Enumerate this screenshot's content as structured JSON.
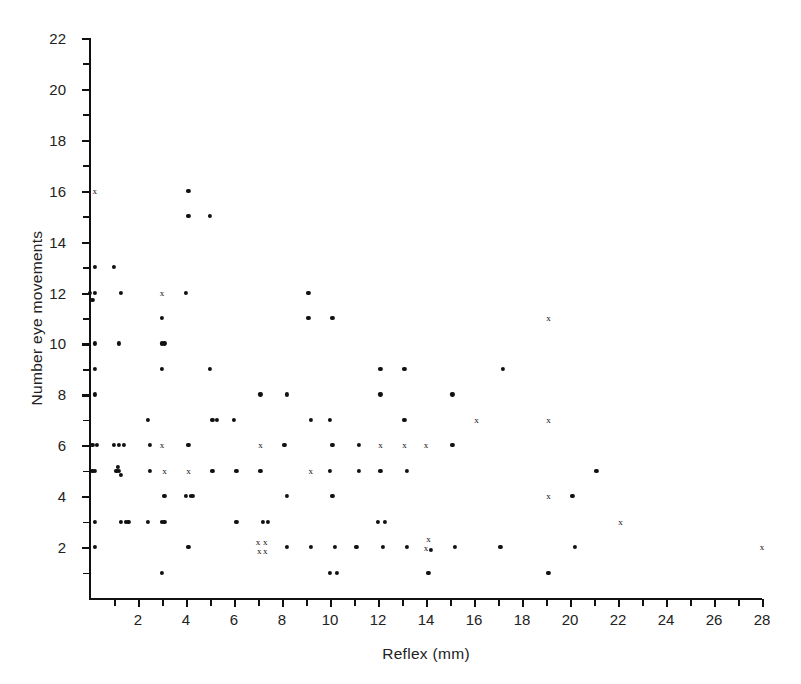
{
  "chart_data": {
    "type": "scatter",
    "title": "",
    "xlabel": "Reflex (mm)",
    "ylabel": "Number eye movements",
    "xlim": [
      0,
      28
    ],
    "ylim": [
      0,
      22
    ],
    "xticks_major": [
      2,
      4,
      6,
      8,
      10,
      12,
      14,
      16,
      18,
      20,
      22,
      24,
      26,
      28
    ],
    "xticks_minor_step": 1,
    "yticks_major": [
      2,
      4,
      6,
      8,
      10,
      12,
      14,
      16,
      18,
      20,
      22
    ],
    "yticks_minor_step": 1,
    "xticklabels": [
      "2",
      "4",
      "6",
      "8",
      "10",
      "12",
      "14",
      "16",
      "18",
      "20",
      "22",
      "24",
      "26",
      "28"
    ],
    "yticklabels": [
      "2",
      "4",
      "6",
      "8",
      "10",
      "12",
      "14",
      "16",
      "18",
      "20",
      "22"
    ],
    "grid": false,
    "legend": false,
    "marker_styles": {
      "dot": "filled round dot",
      "cross": "small x glyph"
    },
    "points": [
      {
        "x": 0.2,
        "y": 16,
        "m": "cross"
      },
      {
        "x": 0.2,
        "y": 13,
        "m": "dot"
      },
      {
        "x": 0.0,
        "y": 12,
        "m": "dot"
      },
      {
        "x": 0.2,
        "y": 12,
        "m": "dot"
      },
      {
        "x": 0.1,
        "y": 11.7,
        "m": "dot"
      },
      {
        "x": 0.2,
        "y": 10,
        "m": "dot"
      },
      {
        "x": 0.2,
        "y": 9,
        "m": "dot"
      },
      {
        "x": 0.2,
        "y": 8,
        "m": "dot"
      },
      {
        "x": 0.1,
        "y": 6,
        "m": "dot"
      },
      {
        "x": 0.3,
        "y": 6,
        "m": "dot"
      },
      {
        "x": 0.2,
        "y": 5,
        "m": "dot"
      },
      {
        "x": 0.1,
        "y": 5,
        "m": "dot"
      },
      {
        "x": 0.2,
        "y": 3,
        "m": "dot"
      },
      {
        "x": 0.2,
        "y": 2,
        "m": "dot"
      },
      {
        "x": 1.0,
        "y": 13,
        "m": "dot"
      },
      {
        "x": 1.3,
        "y": 12,
        "m": "dot"
      },
      {
        "x": 1.2,
        "y": 10,
        "m": "dot"
      },
      {
        "x": 1.0,
        "y": 6,
        "m": "dot"
      },
      {
        "x": 1.2,
        "y": 6,
        "m": "dot"
      },
      {
        "x": 1.4,
        "y": 6,
        "m": "dot"
      },
      {
        "x": 1.1,
        "y": 5,
        "m": "dot"
      },
      {
        "x": 1.2,
        "y": 5,
        "m": "dot"
      },
      {
        "x": 1.3,
        "y": 4.85,
        "m": "dot"
      },
      {
        "x": 1.15,
        "y": 5.15,
        "m": "dot"
      },
      {
        "x": 1.3,
        "y": 3,
        "m": "dot"
      },
      {
        "x": 1.6,
        "y": 3,
        "m": "dot"
      },
      {
        "x": 1.5,
        "y": 3,
        "m": "dot"
      },
      {
        "x": 2.4,
        "y": 7,
        "m": "dot"
      },
      {
        "x": 2.5,
        "y": 6,
        "m": "dot"
      },
      {
        "x": 2.5,
        "y": 5,
        "m": "dot"
      },
      {
        "x": 2.4,
        "y": 3,
        "m": "dot"
      },
      {
        "x": 3.0,
        "y": 12,
        "m": "cross"
      },
      {
        "x": 3.0,
        "y": 11,
        "m": "dot"
      },
      {
        "x": 3.0,
        "y": 10,
        "m": "dot"
      },
      {
        "x": 3.1,
        "y": 10,
        "m": "dot"
      },
      {
        "x": 3.0,
        "y": 9,
        "m": "dot"
      },
      {
        "x": 3.0,
        "y": 6,
        "m": "cross"
      },
      {
        "x": 3.1,
        "y": 5,
        "m": "cross"
      },
      {
        "x": 3.1,
        "y": 4,
        "m": "dot"
      },
      {
        "x": 3.0,
        "y": 3,
        "m": "dot"
      },
      {
        "x": 3.1,
        "y": 3,
        "m": "dot"
      },
      {
        "x": 3.0,
        "y": 1,
        "m": "dot"
      },
      {
        "x": 4.1,
        "y": 16,
        "m": "dot"
      },
      {
        "x": 4.1,
        "y": 15,
        "m": "dot"
      },
      {
        "x": 4.0,
        "y": 12,
        "m": "dot"
      },
      {
        "x": 4.1,
        "y": 6,
        "m": "dot"
      },
      {
        "x": 4.1,
        "y": 5,
        "m": "cross"
      },
      {
        "x": 4.0,
        "y": 4,
        "m": "dot"
      },
      {
        "x": 4.2,
        "y": 4,
        "m": "dot"
      },
      {
        "x": 4.3,
        "y": 4,
        "m": "dot"
      },
      {
        "x": 4.1,
        "y": 2,
        "m": "dot"
      },
      {
        "x": 5.0,
        "y": 15,
        "m": "dot"
      },
      {
        "x": 5.0,
        "y": 9,
        "m": "dot"
      },
      {
        "x": 5.1,
        "y": 7,
        "m": "dot"
      },
      {
        "x": 5.3,
        "y": 7,
        "m": "dot"
      },
      {
        "x": 5.1,
        "y": 5,
        "m": "dot"
      },
      {
        "x": 6.0,
        "y": 7,
        "m": "dot"
      },
      {
        "x": 6.1,
        "y": 5,
        "m": "dot"
      },
      {
        "x": 6.1,
        "y": 3,
        "m": "dot"
      },
      {
        "x": 7.1,
        "y": 8,
        "m": "dot"
      },
      {
        "x": 7.1,
        "y": 6,
        "m": "cross"
      },
      {
        "x": 7.1,
        "y": 5,
        "m": "dot"
      },
      {
        "x": 7.2,
        "y": 3,
        "m": "dot"
      },
      {
        "x": 7.4,
        "y": 3,
        "m": "dot"
      },
      {
        "x": 7.0,
        "y": 2.2,
        "m": "cross"
      },
      {
        "x": 7.3,
        "y": 2.2,
        "m": "cross"
      },
      {
        "x": 7.05,
        "y": 1.85,
        "m": "cross"
      },
      {
        "x": 7.3,
        "y": 1.85,
        "m": "cross"
      },
      {
        "x": 8.2,
        "y": 8,
        "m": "dot"
      },
      {
        "x": 8.1,
        "y": 6,
        "m": "dot"
      },
      {
        "x": 8.2,
        "y": 4,
        "m": "dot"
      },
      {
        "x": 8.2,
        "y": 2,
        "m": "dot"
      },
      {
        "x": 9.1,
        "y": 12,
        "m": "dot"
      },
      {
        "x": 9.1,
        "y": 11,
        "m": "dot"
      },
      {
        "x": 9.2,
        "y": 7,
        "m": "dot"
      },
      {
        "x": 9.2,
        "y": 5,
        "m": "cross"
      },
      {
        "x": 9.2,
        "y": 2,
        "m": "dot"
      },
      {
        "x": 10.1,
        "y": 11,
        "m": "dot"
      },
      {
        "x": 10.0,
        "y": 7,
        "m": "dot"
      },
      {
        "x": 10.1,
        "y": 6,
        "m": "dot"
      },
      {
        "x": 10.0,
        "y": 5,
        "m": "dot"
      },
      {
        "x": 10.1,
        "y": 4,
        "m": "dot"
      },
      {
        "x": 10.2,
        "y": 2,
        "m": "dot"
      },
      {
        "x": 10.0,
        "y": 1,
        "m": "dot"
      },
      {
        "x": 10.3,
        "y": 1,
        "m": "dot"
      },
      {
        "x": 11.2,
        "y": 6,
        "m": "dot"
      },
      {
        "x": 11.2,
        "y": 5,
        "m": "dot"
      },
      {
        "x": 11.1,
        "y": 2,
        "m": "dot"
      },
      {
        "x": 12.1,
        "y": 9,
        "m": "dot"
      },
      {
        "x": 12.1,
        "y": 8,
        "m": "dot"
      },
      {
        "x": 12.1,
        "y": 6,
        "m": "cross"
      },
      {
        "x": 12.1,
        "y": 5,
        "m": "dot"
      },
      {
        "x": 12.0,
        "y": 3,
        "m": "dot"
      },
      {
        "x": 12.3,
        "y": 3,
        "m": "dot"
      },
      {
        "x": 12.2,
        "y": 2,
        "m": "dot"
      },
      {
        "x": 13.1,
        "y": 9,
        "m": "dot"
      },
      {
        "x": 13.1,
        "y": 7,
        "m": "dot"
      },
      {
        "x": 13.1,
        "y": 6,
        "m": "cross"
      },
      {
        "x": 13.2,
        "y": 5,
        "m": "dot"
      },
      {
        "x": 13.2,
        "y": 2,
        "m": "dot"
      },
      {
        "x": 14.0,
        "y": 6,
        "m": "cross"
      },
      {
        "x": 14.1,
        "y": 2.3,
        "m": "cross"
      },
      {
        "x": 14.0,
        "y": 1.95,
        "m": "cross"
      },
      {
        "x": 14.2,
        "y": 1.9,
        "m": "dot"
      },
      {
        "x": 14.1,
        "y": 1,
        "m": "dot"
      },
      {
        "x": 15.1,
        "y": 8,
        "m": "dot"
      },
      {
        "x": 15.1,
        "y": 6,
        "m": "dot"
      },
      {
        "x": 15.2,
        "y": 2,
        "m": "dot"
      },
      {
        "x": 16.1,
        "y": 7,
        "m": "cross"
      },
      {
        "x": 17.2,
        "y": 9,
        "m": "dot"
      },
      {
        "x": 17.1,
        "y": 2,
        "m": "dot"
      },
      {
        "x": 19.1,
        "y": 11,
        "m": "cross"
      },
      {
        "x": 19.1,
        "y": 7,
        "m": "cross"
      },
      {
        "x": 19.1,
        "y": 4,
        "m": "cross"
      },
      {
        "x": 19.1,
        "y": 1,
        "m": "dot"
      },
      {
        "x": 20.1,
        "y": 4,
        "m": "dot"
      },
      {
        "x": 20.2,
        "y": 2,
        "m": "dot"
      },
      {
        "x": 21.1,
        "y": 5,
        "m": "dot"
      },
      {
        "x": 22.1,
        "y": 3,
        "m": "cross"
      },
      {
        "x": 28.0,
        "y": 2,
        "m": "cross"
      }
    ]
  },
  "figure": {
    "background_color": "#ffffff",
    "axis_color": "#111111",
    "marker_color": "#111111"
  }
}
